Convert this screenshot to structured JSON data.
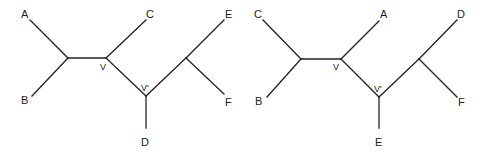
{
  "trees": [
    {
      "name": "left-tree",
      "leaves": {
        "top_left": "A",
        "bottom_left": "B",
        "top_middle": "C",
        "bottom_middle": "D",
        "top_right": "E",
        "bottom_right": "F"
      },
      "internal_nodes": {
        "v": "V",
        "v_prime": "V'"
      }
    },
    {
      "name": "right-tree",
      "leaves": {
        "top_left": "C",
        "bottom_left": "B",
        "top_middle": "A",
        "bottom_middle": "E",
        "top_right": "D",
        "bottom_right": "F"
      },
      "internal_nodes": {
        "v": "V",
        "v_prime": "V'"
      }
    }
  ]
}
